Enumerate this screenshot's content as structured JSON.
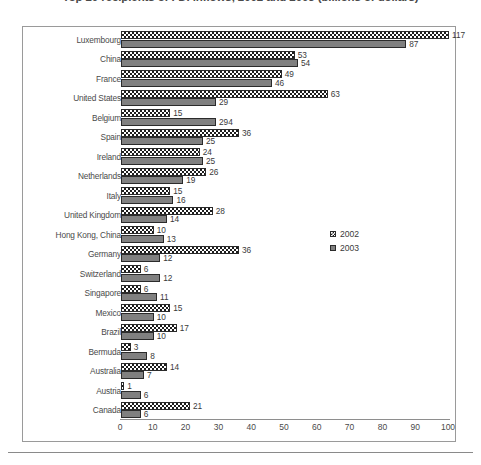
{
  "chart_data": {
    "type": "bar",
    "orientation": "horizontal",
    "title": "Top 20 recipients of FDI inflows, 2002 and 2003 (billions of dollars)",
    "xlabel": "",
    "ylabel": "",
    "xlim": [
      0,
      100
    ],
    "xticks": [
      0,
      10,
      20,
      30,
      40,
      50,
      60,
      70,
      80,
      90,
      100
    ],
    "grid": false,
    "legend_position": "middle-right",
    "categories": [
      "Luxembourg",
      "China",
      "France",
      "United States",
      "Belgium",
      "Spain",
      "Ireland",
      "Netherlands",
      "Italy",
      "United Kingdom",
      "Hong Kong, China",
      "Germany",
      "Switzerland",
      "Singapore",
      "Mexico",
      "Brazil",
      "Bermuda",
      "Australia",
      "Austria",
      "Canada"
    ],
    "series": [
      {
        "name": "2002",
        "color": "#ffffff",
        "pattern": "checkerboard",
        "values": [
          117,
          53,
          49,
          63,
          15,
          36,
          24,
          26,
          15,
          28,
          10,
          36,
          6,
          6,
          15,
          17,
          3,
          14,
          1,
          21
        ]
      },
      {
        "name": "2003",
        "color": "#808080",
        "pattern": "solid",
        "values": [
          87,
          54,
          46,
          29,
          294,
          25,
          25,
          19,
          16,
          14,
          13,
          12,
          12,
          11,
          10,
          10,
          8,
          7,
          6,
          6
        ]
      }
    ],
    "series_bar_lengths_2003": [
      87,
      54,
      46,
      29,
      29,
      25,
      25,
      19,
      16,
      14,
      13,
      12,
      12,
      11,
      10,
      10,
      8,
      7,
      6,
      6
    ],
    "legend": [
      "2002",
      "2003"
    ]
  }
}
